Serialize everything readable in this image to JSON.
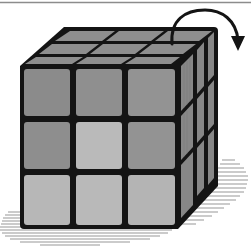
{
  "figure": {
    "subject": "Rubik's cube (3x3x3) with top-layer rotation arrow",
    "caption": "",
    "colors": {
      "outline": "#141414",
      "cell_dark": "#8b8b8b",
      "cell_mid": "#939393",
      "cell_light": "#bababa",
      "top_face": "#8e8e8e",
      "right_face": "#878787",
      "shadow_hatch": "#6a6a6a",
      "background": "#ffffff",
      "rule_line": "#8c8c8c"
    },
    "front_face": {
      "rows": [
        [
          "dark",
          "dark",
          "dark"
        ],
        [
          "dark",
          "light",
          "dark"
        ],
        [
          "light",
          "light",
          "light"
        ]
      ]
    },
    "arrow": {
      "direction": "clockwise",
      "meaning": "rotate top layer to the right"
    }
  }
}
